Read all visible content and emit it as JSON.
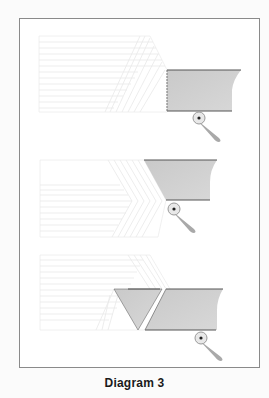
{
  "caption": "Diagram 3",
  "colors": {
    "frame_border": "#8a8a8a",
    "background_lines": "#e6e6e6",
    "shaded_fill": "#cfcfcf",
    "shaded_edge": "#555555",
    "pivot_fill": "#e8e8e8",
    "pivot_stroke": "#9a9a9a",
    "arm_fill": "#a9a9a9"
  },
  "panels": [
    {
      "name": "step-1",
      "description": "Rectangular shaded piece with pivot below"
    },
    {
      "name": "step-2",
      "description": "Shaded piece trimmed at left diagonal, pivot below"
    },
    {
      "name": "step-3",
      "description": "Shaded piece split into a triangle and a parallelogram, pivot below"
    }
  ]
}
